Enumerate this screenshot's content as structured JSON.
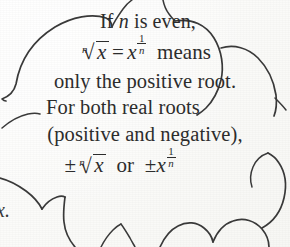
{
  "document": {
    "kind": "textbook-scan",
    "background_color": "#fdfdfc",
    "ink_color": "#2d2d2d",
    "outline_color": "#3a3a3a"
  },
  "callout": {
    "shape": "cloud-bubble",
    "lines": [
      {
        "id": "line-1",
        "kind": "text",
        "text": "If n is even,",
        "parts": [
          {
            "type": "word",
            "text": "If"
          },
          {
            "type": "math-var",
            "text": "n"
          },
          {
            "type": "word",
            "text": "is even,"
          }
        ]
      },
      {
        "id": "line-2",
        "kind": "equation",
        "text": "n√x = x^(1/n) means",
        "radical_index": "n",
        "radicand": "x",
        "equals": "=",
        "base": "x",
        "exponent_numerator": "1",
        "exponent_denominator": "n",
        "trailing_word": "means"
      },
      {
        "id": "line-3",
        "kind": "text",
        "text": "only the positive root."
      },
      {
        "id": "line-4",
        "kind": "text",
        "text": "For both real roots"
      },
      {
        "id": "line-5",
        "kind": "text",
        "text": "(positive and negative),"
      },
      {
        "id": "line-6",
        "kind": "equation",
        "text": "±n√x or ±x^(1/n)",
        "plus_minus": "±",
        "radical_index": "n",
        "radicand": "x",
        "conjunction": "or",
        "plus_minus_2": "±",
        "base": "x",
        "exponent_numerator": "1",
        "exponent_denominator": "n"
      }
    ]
  },
  "edge": {
    "cropped_neighbour_text": "x."
  }
}
